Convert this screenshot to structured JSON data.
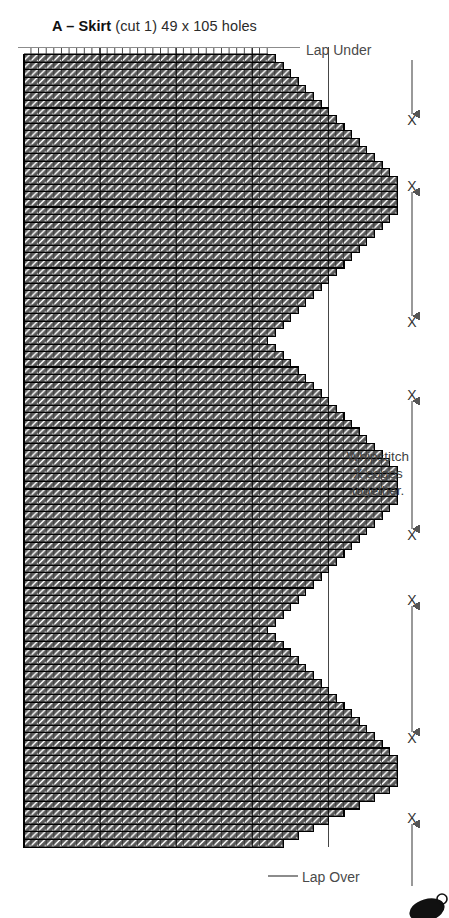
{
  "document": {
    "kind": "plastic-canvas-stitch-chart",
    "title": {
      "piece_letter": "A – Skirt",
      "details": " (cut 1) 49 x 105 holes",
      "full": "A – Skirt (cut 1) 49 x 105 holes"
    }
  },
  "labels": {
    "lap_under": "Lap Under",
    "lap_over": "Lap Over",
    "whipstitch": "Whipstitch X edges together.",
    "whipstitch_lines": [
      "Whipstitch",
      "X edges",
      "together."
    ]
  },
  "colors": {
    "stitch_fill": "#595959",
    "stitch_highlight": "#ffffff",
    "cell_outline": "#000000",
    "grid_major": "#000000",
    "annotation_text": "#4a4a4a",
    "title_text": "#111111",
    "leader_line": "#8c8c8c",
    "arrow": "#555555",
    "background": "#ffffff"
  },
  "chart_data": {
    "type": "heatmap",
    "title": "A – Skirt (cut 1) 49 x 105 holes",
    "xlabel": "",
    "ylabel": "",
    "grid": true,
    "cols": 49,
    "rows": 105,
    "cell_px": 7.62,
    "origin_x": 24,
    "origin_y": 47,
    "major_grid_every": 10,
    "legend_position": "right",
    "stitch_symbol": "diagonal-slant",
    "row_widths_note": "row index 0 = top row. Value = number of filled cells from the left edge.",
    "row_widths": [
      32,
      33,
      34,
      35,
      36,
      37,
      38,
      39,
      40,
      41,
      42,
      43,
      44,
      45,
      46,
      47,
      48,
      49,
      49,
      49,
      49,
      49,
      48,
      47,
      46,
      45,
      44,
      43,
      42,
      41,
      40,
      39,
      38,
      37,
      36,
      35,
      34,
      33,
      32,
      33,
      34,
      35,
      36,
      37,
      38,
      39,
      40,
      41,
      42,
      43,
      44,
      45,
      46,
      47,
      48,
      49,
      49,
      49,
      49,
      49,
      48,
      47,
      46,
      45,
      44,
      43,
      42,
      41,
      40,
      39,
      38,
      37,
      36,
      35,
      34,
      33,
      32,
      33,
      34,
      35,
      36,
      37,
      38,
      39,
      40,
      41,
      42,
      43,
      44,
      45,
      46,
      47,
      48,
      49,
      49,
      49,
      49,
      48,
      46,
      44,
      42,
      40,
      38,
      36,
      34
    ],
    "edge_markers": [
      {
        "label": "X",
        "y": 120
      },
      {
        "label": "X",
        "y": 186
      },
      {
        "label": "X",
        "y": 322
      },
      {
        "label": "X",
        "y": 395
      },
      {
        "label": "X",
        "y": 535
      },
      {
        "label": "X",
        "y": 600
      },
      {
        "label": "X",
        "y": 738
      },
      {
        "label": "X",
        "y": 818
      }
    ],
    "arrows": [
      {
        "from_y": 60,
        "to_y": 114,
        "heads": "down"
      },
      {
        "from_y": 192,
        "to_y": 316,
        "heads": "both"
      },
      {
        "from_y": 401,
        "to_y": 529,
        "heads": "both"
      },
      {
        "from_y": 606,
        "to_y": 732,
        "heads": "both"
      },
      {
        "from_y": 824,
        "to_y": 886,
        "heads": "up"
      }
    ]
  }
}
